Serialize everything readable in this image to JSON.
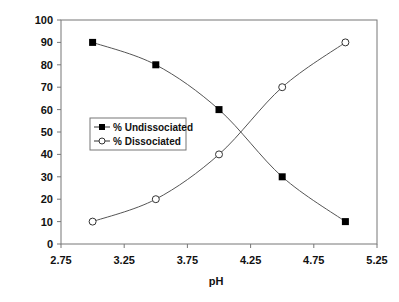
{
  "chart_data": {
    "type": "line",
    "title": "",
    "xlabel": "pH",
    "ylabel": "Percent (%)",
    "xlim": [
      2.75,
      5.25
    ],
    "ylim": [
      0,
      100
    ],
    "xticks": [
      "2.75",
      "3.25",
      "3.75",
      "4.25",
      "4.75",
      "5.25"
    ],
    "xtick_values": [
      2.75,
      3.25,
      3.75,
      4.25,
      4.75,
      5.25
    ],
    "yticks": [
      "0",
      "10",
      "20",
      "30",
      "40",
      "50",
      "60",
      "70",
      "80",
      "90",
      "100"
    ],
    "ytick_values": [
      0,
      10,
      20,
      30,
      40,
      50,
      60,
      70,
      80,
      90,
      100
    ],
    "grid": false,
    "legend_position": "center-left",
    "x": [
      3.0,
      3.5,
      4.0,
      4.5,
      5.0
    ],
    "series": [
      {
        "name": "% Undissociated",
        "marker": "filled-square",
        "values": [
          90,
          80,
          60,
          30,
          10
        ]
      },
      {
        "name": "% Dissociated",
        "marker": "open-circle",
        "values": [
          10,
          20,
          40,
          70,
          90
        ]
      }
    ],
    "colors": {
      "line": "#555555",
      "marker": "#000000",
      "frame": "#777777"
    }
  }
}
